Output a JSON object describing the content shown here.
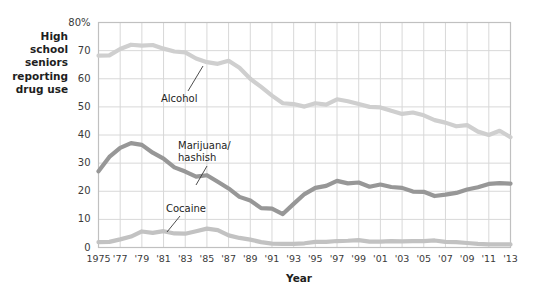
{
  "chart_data": {
    "type": "line",
    "title": "",
    "ylabel": "High school\nseniors\nreporting\ndrug use",
    "xlabel": "Year",
    "ylim": [
      0,
      80
    ],
    "xlim": [
      1975,
      2013
    ],
    "grid": true,
    "legend_position": "inline-annotations",
    "yticks": [
      "0",
      "10",
      "20",
      "30",
      "40",
      "50",
      "60",
      "70",
      "80%"
    ],
    "ytick_values": [
      0,
      10,
      20,
      30,
      40,
      50,
      60,
      70,
      80
    ],
    "xticks": [
      "1975",
      "'77",
      "'79",
      "'81",
      "'83",
      "'85",
      "'87",
      "'89",
      "'91",
      "'93",
      "'95",
      "'97",
      "'99",
      "'01",
      "'03",
      "'05",
      "'07",
      "'09",
      "'11",
      "'13"
    ],
    "xtick_values": [
      1975,
      1977,
      1979,
      1981,
      1983,
      1985,
      1987,
      1989,
      1991,
      1993,
      1995,
      1997,
      1999,
      2001,
      2003,
      2005,
      2007,
      2009,
      2011,
      2013
    ],
    "x": [
      1975,
      1976,
      1977,
      1978,
      1979,
      1980,
      1981,
      1982,
      1983,
      1984,
      1985,
      1986,
      1987,
      1988,
      1989,
      1990,
      1991,
      1992,
      1993,
      1994,
      1995,
      1996,
      1997,
      1998,
      1999,
      2000,
      2001,
      2002,
      2003,
      2004,
      2005,
      2006,
      2007,
      2008,
      2009,
      2010,
      2011,
      2012,
      2013
    ],
    "series": [
      {
        "name": "Alcohol",
        "color": "#cfcfcf",
        "label_text": "Alcohol",
        "values": [
          68.2,
          68.3,
          70.6,
          72.1,
          71.8,
          72.0,
          70.7,
          69.7,
          69.4,
          67.2,
          65.9,
          65.3,
          66.4,
          63.9,
          60.0,
          57.1,
          54.0,
          51.3,
          51.0,
          50.1,
          51.3,
          50.8,
          52.7,
          52.0,
          51.0,
          50.0,
          49.8,
          48.6,
          47.5,
          48.0,
          47.0,
          45.3,
          44.4,
          43.1,
          43.5,
          41.2,
          40.0,
          41.5,
          39.2
        ]
      },
      {
        "name": "Marijuana/hashish",
        "color": "#979797",
        "label_text": "Marijuana/\nhashish",
        "values": [
          27.1,
          32.2,
          35.4,
          37.1,
          36.5,
          33.7,
          31.6,
          28.5,
          27.0,
          25.2,
          25.7,
          23.4,
          21.0,
          18.0,
          16.7,
          14.0,
          13.8,
          11.9,
          15.5,
          19.0,
          21.2,
          21.9,
          23.7,
          22.8,
          23.1,
          21.6,
          22.4,
          21.5,
          21.2,
          19.9,
          19.8,
          18.3,
          18.8,
          19.4,
          20.6,
          21.4,
          22.6,
          22.9,
          22.7
        ]
      },
      {
        "name": "Cocaine",
        "color": "#c2c2c2",
        "label_text": "Cocaine",
        "values": [
          1.9,
          2.0,
          2.9,
          3.9,
          5.7,
          5.2,
          5.8,
          5.0,
          4.9,
          5.8,
          6.7,
          6.2,
          4.3,
          3.4,
          2.8,
          1.9,
          1.4,
          1.3,
          1.3,
          1.5,
          2.0,
          2.0,
          2.3,
          2.4,
          2.6,
          2.1,
          2.1,
          2.3,
          2.2,
          2.3,
          2.3,
          2.5,
          2.0,
          1.9,
          1.6,
          1.3,
          1.1,
          1.1,
          1.1
        ]
      }
    ]
  },
  "axes": {
    "y_title": "High school\nseniors\nreporting\ndrug use",
    "x_title": "Year"
  },
  "annotations": [
    {
      "name": "alcohol",
      "text": "Alcohol"
    },
    {
      "name": "marijuana",
      "text": "Marijuana/\nhashish"
    },
    {
      "name": "cocaine",
      "text": "Cocaine"
    }
  ],
  "colors": {
    "alcohol": "#cfcfcf",
    "marijuana": "#979797",
    "cocaine": "#c2c2c2",
    "grid": "#d8d8d8",
    "frame": "#c0c0c0",
    "background": "#ffffff",
    "text": "#2b2b2b"
  }
}
